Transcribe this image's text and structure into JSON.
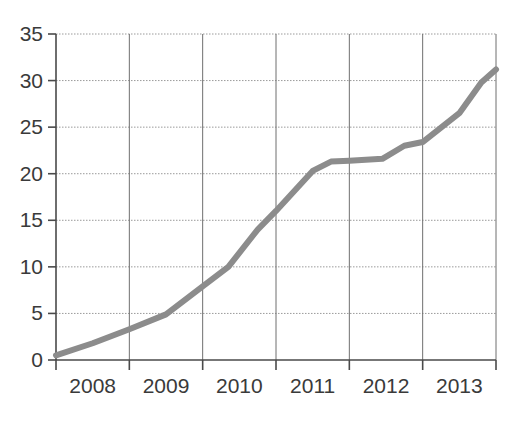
{
  "chart_data": {
    "type": "line",
    "title": "",
    "subtitle": "",
    "xlabel": "",
    "ylabel": "",
    "legend": [],
    "legend_position": "none",
    "grid": true,
    "grid_style": {
      "horizontal": "dotted",
      "vertical": "solid"
    },
    "xlim": [
      2007.55,
      2013.55
    ],
    "ylim": [
      0,
      35
    ],
    "yticks": [
      0,
      5,
      10,
      15,
      20,
      25,
      30,
      35
    ],
    "ytick_labels": [
      "0",
      "5",
      "10",
      "15",
      "20",
      "25",
      "30",
      "35"
    ],
    "xticks": [
      2007.55,
      2008.55,
      2009.55,
      2010.55,
      2011.55,
      2012.55,
      2013.55
    ],
    "categories": [
      "2008",
      "2009",
      "2010",
      "2011",
      "2012",
      "2013"
    ],
    "xtick_labels": [
      "2008",
      "2009",
      "2010",
      "2011",
      "2012",
      "2013"
    ],
    "series": [
      {
        "name": "series-1",
        "color": "#8c8c8c",
        "x": [
          2007.55,
          2008.05,
          2008.55,
          2009.05,
          2009.55,
          2009.9,
          2010.3,
          2010.55,
          2011.05,
          2011.3,
          2011.55,
          2012.0,
          2012.3,
          2012.55,
          2013.05,
          2013.35,
          2013.55
        ],
        "y": [
          0.5,
          1.8,
          3.3,
          4.9,
          7.9,
          10.0,
          14.0,
          16.0,
          20.3,
          21.3,
          21.4,
          21.6,
          23.0,
          23.4,
          26.5,
          29.8,
          31.2
        ],
        "values": [
          0.5,
          1.8,
          3.3,
          4.9,
          7.9,
          10.0,
          14.0,
          16.0,
          20.3,
          21.3,
          21.4,
          21.6,
          23.0,
          23.4,
          26.5,
          29.8,
          31.2
        ]
      }
    ],
    "annotations": []
  },
  "axes": {
    "y_axis_name": "y-axis",
    "x_axis_name": "x-axis"
  },
  "colors": {
    "line": "#8c8c8c",
    "axis": "#4a4a4a",
    "grid_h": "#9a9a9a",
    "grid_v": "#6f6f6f",
    "text": "#3a3a3a",
    "background": "#ffffff"
  }
}
